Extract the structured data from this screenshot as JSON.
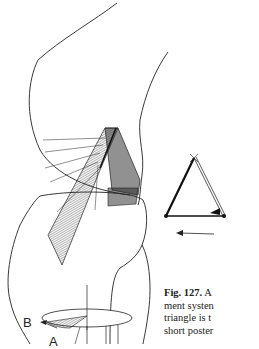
{
  "figure": {
    "labels": {
      "b": "B",
      "a": "A"
    },
    "inset": {
      "description": "triangle with arrow pointing left"
    },
    "caption": {
      "number": "Fig. 127.",
      "lines": [
        " A",
        "ment systen",
        "triangle is t",
        "short poster"
      ]
    },
    "colors": {
      "ink": "#222222",
      "background": "#ffffff"
    }
  }
}
